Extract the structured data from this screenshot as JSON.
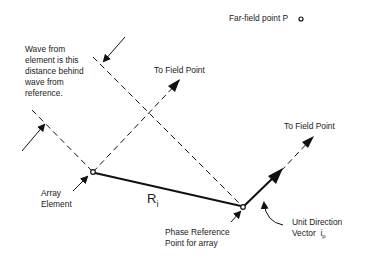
{
  "labels": {
    "far_field": "Far-field point P",
    "wave_note": [
      "Wave from",
      "element is this",
      "distance behind",
      "wave from",
      "reference."
    ],
    "to_field_point_1": "To Field Point",
    "to_field_point_2": "To Field Point",
    "array_element": [
      "Array",
      "Element"
    ],
    "ri_main": "R",
    "ri_sub": "i",
    "phase_ref": [
      "Phase Reference",
      "Point for array"
    ],
    "unit_dir": [
      "Unit Direction",
      "Vector"
    ],
    "unit_vec_main": "i",
    "unit_vec_sub": "p"
  },
  "colors": {
    "line": "#111111",
    "background": "#ffffff"
  },
  "geometry": {
    "array_element": [
      93,
      172
    ],
    "reference_point": [
      243,
      207
    ],
    "far_field_point": [
      301,
      19
    ]
  }
}
